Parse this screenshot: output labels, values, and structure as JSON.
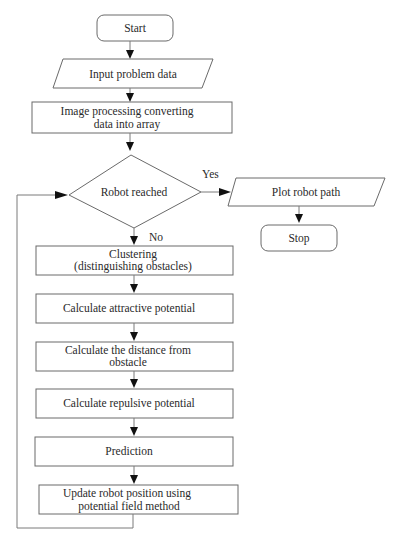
{
  "flowchart": {
    "nodes": {
      "start": {
        "label": "Start",
        "shape": "terminator"
      },
      "input": {
        "label": "Input problem data",
        "shape": "parallelogram"
      },
      "image_processing": {
        "line1": "Image processing converting",
        "line2": "data into array",
        "shape": "process"
      },
      "decision": {
        "label": "Robot reached",
        "shape": "decision"
      },
      "plot": {
        "label": "Plot robot path",
        "shape": "parallelogram"
      },
      "stop": {
        "label": "Stop",
        "shape": "terminator"
      },
      "clustering": {
        "line1": "Clustering",
        "line2": "(distinguishing obstacles)",
        "shape": "process"
      },
      "attractive": {
        "label": "Calculate attractive potential",
        "shape": "process"
      },
      "distance": {
        "line1": "Calculate the distance from",
        "line2": "obstacle",
        "shape": "process"
      },
      "repulsive": {
        "label": "Calculate repulsive potential",
        "shape": "process"
      },
      "prediction": {
        "label": "Prediction",
        "shape": "process"
      },
      "update": {
        "line1": "Update robot position using",
        "line2": "potential field method",
        "shape": "process"
      }
    },
    "edge_labels": {
      "yes": "Yes",
      "no": "No"
    },
    "colors": {
      "stroke": "#6a6a6a",
      "arrowhead": "#111111",
      "text": "#2a2a2a",
      "background": "#ffffff"
    }
  }
}
